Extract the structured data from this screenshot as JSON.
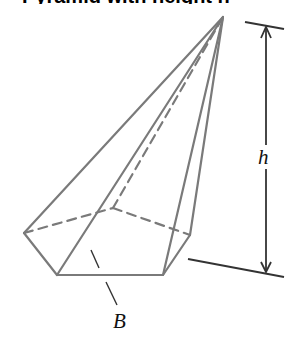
{
  "title": "Pyramid with height h",
  "figure": {
    "type": "pentagonal pyramid",
    "labels": {
      "height": "h",
      "base": "B"
    },
    "colors": {
      "edge": "#7a7a7a",
      "dimension": "#333333",
      "label": "#111111"
    }
  }
}
